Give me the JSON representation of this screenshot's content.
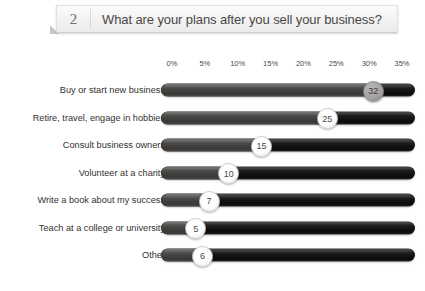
{
  "header": {
    "number": "2",
    "question": "What are your plans after you sell your business?"
  },
  "chart_data": {
    "type": "bar",
    "orientation": "horizontal",
    "title": "What are your plans after you sell your business?",
    "xlabel": "",
    "ylabel": "",
    "xlim": [
      0,
      35
    ],
    "grid": false,
    "legend": false,
    "tick_labels": [
      "0%",
      "5%",
      "10%",
      "15%",
      "20%",
      "25%",
      "30%",
      "35%"
    ],
    "tick_values": [
      0,
      5,
      10,
      15,
      20,
      25,
      30,
      35
    ],
    "categories": [
      "Buy or start new business",
      "Retire, travel, engage in hobbies",
      "Consult business owners",
      "Volunteer at a charity",
      "Write a book about my success",
      "Teach at a college or university",
      "Other"
    ],
    "values": [
      32,
      25,
      15,
      10,
      7,
      5,
      6
    ],
    "value_labels": [
      "32",
      "25",
      "15",
      "10",
      "7",
      "5",
      "6"
    ],
    "marker_styles": [
      "dark",
      "light",
      "light",
      "light",
      "light",
      "light",
      "light"
    ],
    "colors": {
      "track": "#121010",
      "fill": "#474444",
      "marker_light": "#ffffff",
      "marker_dark": "#a9a6a6",
      "label_text": "#333131",
      "tick_text": "#4b4949"
    }
  }
}
